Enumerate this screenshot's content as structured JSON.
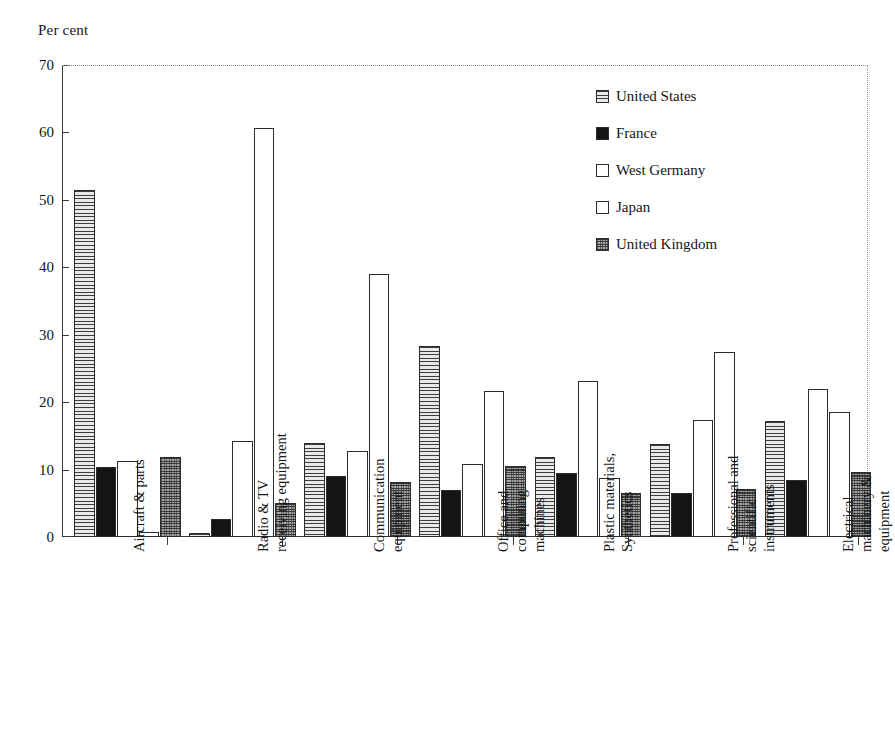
{
  "axis_title": "Per cent",
  "legend": {
    "position": "top-right",
    "entries": [
      {
        "label": "United States",
        "pattern": "horizontal-lines",
        "swatch": "fill-hlines"
      },
      {
        "label": "France",
        "pattern": "solid-black",
        "swatch": "fill-solid"
      },
      {
        "label": "West Germany",
        "pattern": "empty-white",
        "swatch": "fill-empty"
      },
      {
        "label": "Japan",
        "pattern": "empty-white",
        "swatch": "fill-empty"
      },
      {
        "label": "United Kingdom",
        "pattern": "grey-checker",
        "swatch": "fill-checker"
      }
    ]
  },
  "yaxis": {
    "label": "Per cent",
    "min": 0,
    "max": 70,
    "step": 10,
    "ticks": [
      "0",
      "10",
      "20",
      "30",
      "40",
      "50",
      "60",
      "70"
    ]
  },
  "category_label_lines": [
    [
      "Aircraft & parts"
    ],
    [
      "Radio & TV",
      "receiving equipment"
    ],
    [
      "Communication",
      "equipment"
    ],
    [
      "Office and",
      "computing",
      "machines"
    ],
    [
      "Plastic materials,",
      "Synthetics"
    ],
    [
      "Professional and",
      "scientific",
      "instruments"
    ],
    [
      "Electrical",
      "machinery &",
      "equipment"
    ]
  ],
  "chart_data": {
    "type": "bar",
    "title": "",
    "xlabel": "",
    "ylabel": "Per cent",
    "ylim": [
      0,
      70
    ],
    "grid": false,
    "legend_position": "top-right",
    "categories": [
      "Aircraft & parts",
      "Radio & TV receiving equipment",
      "Communication equipment",
      "Office and computing machines",
      "Plastic materials, Synthetics",
      "Professional and scientific instruments",
      "Electrical machinery & equipment"
    ],
    "series": [
      {
        "name": "United States",
        "values": [
          51.5,
          0.6,
          14.0,
          28.3,
          11.9,
          13.8,
          17.2
        ]
      },
      {
        "name": "France",
        "values": [
          10.4,
          2.7,
          9.0,
          6.9,
          9.5,
          6.5,
          8.5
        ]
      },
      {
        "name": "West Germany",
        "values": [
          11.2,
          14.3,
          12.8,
          10.9,
          23.1,
          17.3,
          22.0
        ]
      },
      {
        "name": "Japan",
        "values": [
          0.8,
          60.6,
          39.0,
          21.7,
          8.8,
          27.5,
          18.6
        ]
      },
      {
        "name": "United Kingdom",
        "values": [
          11.8,
          5.0,
          8.1,
          10.6,
          6.6,
          7.1,
          9.6
        ]
      }
    ]
  }
}
